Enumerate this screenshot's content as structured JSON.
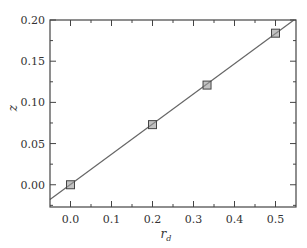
{
  "chart_data": {
    "type": "scatter",
    "title": "",
    "xlabel": "r_d",
    "ylabel": "z",
    "xlim": [
      -0.05,
      0.55
    ],
    "ylim": [
      -0.027,
      0.2
    ],
    "grid": false,
    "legend": null,
    "x_ticks": [
      0.0,
      0.1,
      0.2,
      0.3,
      0.4,
      0.5
    ],
    "x_tick_labels": [
      "0.0",
      "0.1",
      "0.2",
      "0.3",
      "0.4",
      "0.5"
    ],
    "y_ticks": [
      0.0,
      0.05,
      0.1,
      0.15,
      0.2
    ],
    "y_tick_labels": [
      "0.00",
      "0.05",
      "0.10",
      "0.15",
      "0.20"
    ],
    "series": [
      {
        "name": "data points",
        "kind": "scatter",
        "marker": "square",
        "x": [
          0.0,
          0.2,
          0.333,
          0.5
        ],
        "y": [
          0.0,
          0.073,
          0.121,
          0.184
        ]
      },
      {
        "name": "linear fit",
        "kind": "line",
        "x": [
          -0.05,
          0.545
        ],
        "y": [
          -0.018,
          0.2
        ]
      }
    ]
  },
  "labels": {
    "x_main": "r",
    "x_sub": "d",
    "y": "z"
  },
  "colors": {
    "axes": "#444444",
    "line": "#666666",
    "marker_fill": "#999999",
    "marker_edge": "#444444"
  }
}
